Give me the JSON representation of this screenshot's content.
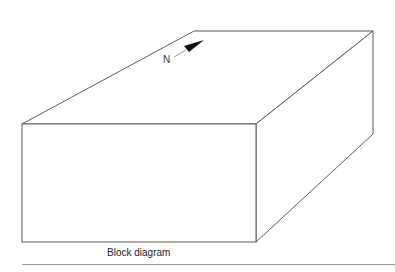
{
  "figure": {
    "title": "Block diagram",
    "caption": "Block diagram",
    "compass": {
      "label": "N",
      "icon": "north-arrow-icon"
    },
    "block": {
      "vertices": {
        "top_back_left": [
          194,
          31
        ],
        "top_back_right": [
          373,
          31
        ],
        "top_front_left": [
          22,
          124
        ],
        "top_front_right": [
          256,
          124
        ],
        "bottom_front_left": [
          22,
          242
        ],
        "bottom_front_right": [
          256,
          242
        ],
        "bottom_back_right": [
          373,
          134
        ]
      },
      "colors": {
        "edge": "#5a5a5a",
        "fill": "#ffffff"
      }
    },
    "separator_color": "#9a9a9a"
  }
}
